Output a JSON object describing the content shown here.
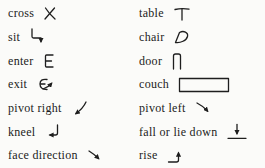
{
  "legend": {
    "left": [
      {
        "label": "cross",
        "symbol": "x-mark"
      },
      {
        "label": "sit",
        "symbol": "arrow-right-then-down"
      },
      {
        "label": "enter",
        "symbol": "letter-e"
      },
      {
        "label": "exit",
        "symbol": "letter-e-with-arrow"
      },
      {
        "label": "pivot right",
        "symbol": "curved-arrow-down-left"
      },
      {
        "label": "kneel",
        "symbol": "return-arrow-left"
      },
      {
        "label": "face direction",
        "symbol": "arrow-down-right"
      }
    ],
    "right": [
      {
        "label": "table",
        "symbol": "t-shape"
      },
      {
        "label": "chair",
        "symbol": "rounded-seat-outline"
      },
      {
        "label": "door",
        "symbol": "pi-shape"
      },
      {
        "label": "couch",
        "symbol": "rectangle-outline"
      },
      {
        "label": "pivot left",
        "symbol": "curved-arrow-down-right"
      },
      {
        "label": "fall or lie down",
        "symbol": "arrow-down-onto-line"
      },
      {
        "label": "rise",
        "symbol": "line-turn-up-arrow"
      }
    ],
    "colors": {
      "ink": "#1e1e1e",
      "background": "#fbfbf9"
    }
  }
}
